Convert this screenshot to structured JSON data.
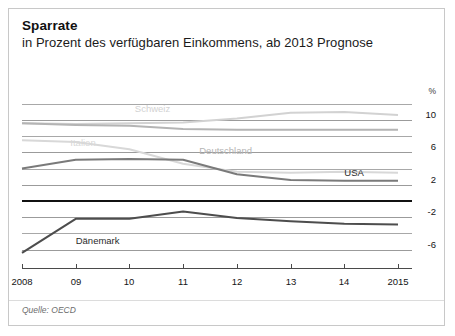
{
  "header": {
    "title": "Sparrate",
    "subtitle": "in Prozent des verfügbaren Einkommens, ab 2013 Prognose"
  },
  "footer": {
    "source": "Quelle: OECD"
  },
  "chart_data": {
    "type": "line",
    "title": "Sparrate",
    "subtitle": "in Prozent des verfügbaren Einkommens, ab 2013 Prognose",
    "xlabel": "",
    "ylabel": "%",
    "unit": "%",
    "x": [
      2008,
      2009,
      2010,
      2011,
      2012,
      2013,
      2014,
      2015
    ],
    "xticklabels": [
      "2008",
      "09",
      "10",
      "11",
      "12",
      "13",
      "14",
      "2015"
    ],
    "ylim": [
      -8,
      12
    ],
    "yticks": [
      10,
      6,
      2,
      -2,
      -6
    ],
    "yticklabels": [
      "10",
      "6",
      "2",
      "-2",
      "-6"
    ],
    "gridlines": [
      12,
      10,
      8,
      6,
      4,
      2,
      0,
      -2,
      -4,
      -6
    ],
    "zero_line": 0,
    "grid": true,
    "legend": "inline-labels",
    "forecast_from": 2013,
    "series": [
      {
        "name": "Schweiz",
        "color": "#d2d2d2",
        "label_x": 2010.1,
        "label_y": 11.3,
        "values": [
          9.6,
          9.5,
          9.6,
          9.7,
          10.2,
          10.9,
          11.0,
          10.6
        ]
      },
      {
        "name": "Italien",
        "color": "#d8d8d8",
        "label_x": 2008.9,
        "label_y": 7.2,
        "values": [
          7.5,
          7.3,
          6.4,
          4.6,
          3.6,
          3.5,
          3.6,
          3.5
        ]
      },
      {
        "name": "Deutschland",
        "color": "#b4b4b4",
        "label_x": 2011.3,
        "label_y": 6.2,
        "values": [
          9.6,
          9.4,
          9.3,
          8.9,
          8.8,
          8.8,
          8.8,
          8.8
        ]
      },
      {
        "name": "USA",
        "color": "#7a7a7a",
        "label_x": 2014.0,
        "label_y": 3.5,
        "values": [
          4.0,
          5.1,
          5.2,
          5.1,
          3.3,
          2.6,
          2.5,
          2.5
        ]
      },
      {
        "name": "Dänemark",
        "color": "#4d4d4d",
        "label_x": 2009.0,
        "label_y": -4.9,
        "values": [
          -6.4,
          -2.2,
          -2.2,
          -1.3,
          -2.1,
          -2.5,
          -2.8,
          -2.9
        ]
      }
    ]
  }
}
